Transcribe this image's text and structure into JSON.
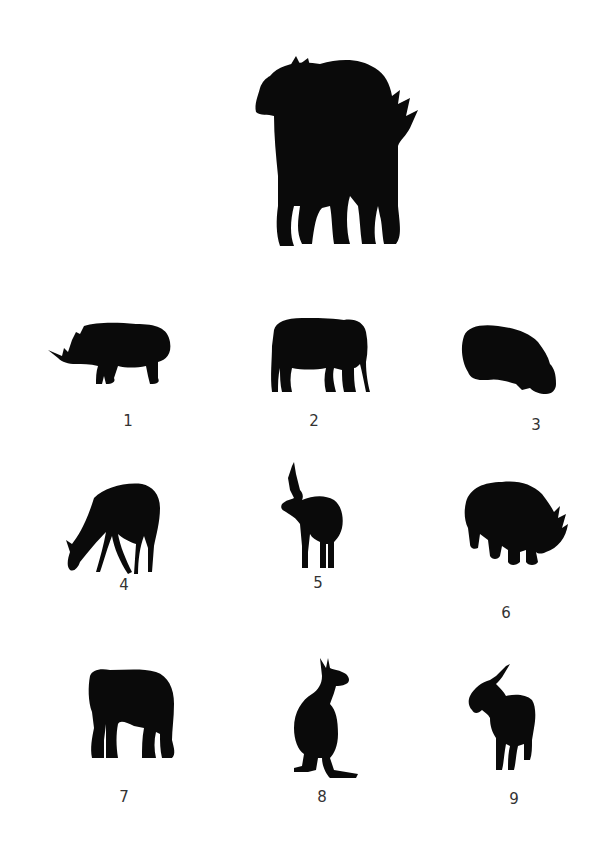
{
  "puzzle": {
    "composite": {
      "description": "overlapping silhouettes of several animals",
      "icon": "composite-silhouette-icon"
    },
    "options": [
      {
        "label": "1",
        "animal": "rhinoceros",
        "icon": "rhino-side-icon"
      },
      {
        "label": "2",
        "animal": "elephant",
        "icon": "elephant-side-icon"
      },
      {
        "label": "3",
        "animal": "hippopotamus",
        "icon": "hippo-grazing-icon"
      },
      {
        "label": "4",
        "animal": "deer",
        "icon": "deer-grazing-icon"
      },
      {
        "label": "5",
        "animal": "antelope",
        "icon": "antelope-icon"
      },
      {
        "label": "6",
        "animal": "rhinoceros",
        "icon": "rhino-front-icon"
      },
      {
        "label": "7",
        "animal": "elephant",
        "icon": "elephant-front-icon"
      },
      {
        "label": "8",
        "animal": "kangaroo",
        "icon": "kangaroo-icon"
      },
      {
        "label": "9",
        "animal": "goat",
        "icon": "goat-icon"
      }
    ],
    "colors": {
      "silhouette": "#0a0a0a",
      "label": "#333333",
      "background": "#ffffff"
    }
  }
}
